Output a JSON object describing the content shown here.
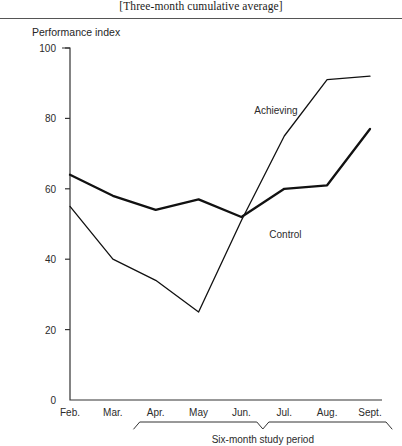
{
  "figure": {
    "title": "[Three-month cumulative average]",
    "axis_title": "Performance index"
  },
  "chart_data": {
    "type": "line",
    "title": "[Three-month cumulative average]",
    "xlabel": "Six-month study period",
    "ylabel": "Performance index",
    "ylim": [
      0,
      100
    ],
    "xlim": [
      0,
      7
    ],
    "grid": false,
    "legend": "inline-annotations",
    "categories": [
      "Feb.",
      "Mar.",
      "Apr.",
      "May",
      "Jun.",
      "Jul.",
      "Aug.",
      "Sept."
    ],
    "yticks": [
      0,
      20,
      40,
      60,
      80,
      100
    ],
    "series": [
      {
        "name": "Control",
        "style": "thick",
        "label_position": "below-right-of-crossover",
        "values": [
          64,
          58,
          54,
          57,
          52,
          60,
          61,
          77
        ]
      },
      {
        "name": "Achieving",
        "style": "thin",
        "label_position": "above-left-of-rise",
        "values": [
          55,
          40,
          34,
          25,
          51,
          75,
          91,
          92
        ]
      }
    ],
    "annotations": [
      {
        "text": "Achieving",
        "x": 4.3,
        "y": 82
      },
      {
        "text": "Control",
        "x": 4.65,
        "y": 47
      },
      {
        "text": "Six-month study period",
        "x": 4.35,
        "y": -16
      }
    ],
    "brace": {
      "label": "Six-month study period",
      "from_category": "Apr.",
      "to_category": "Sept."
    }
  }
}
